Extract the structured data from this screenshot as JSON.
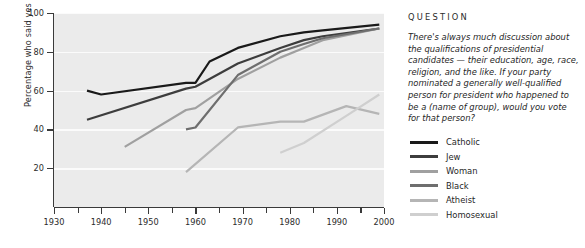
{
  "question": {
    "heading": "QUESTION",
    "body": "There's always much discussion about the qualifications of presidential candidates — their education, age, race, religion, and the like. If your party nominated a generally well-qualified person for president who happened to be a (name of group), would you vote for that person?"
  },
  "chart_data": {
    "type": "line",
    "title": "",
    "xlabel": "",
    "ylabel": "Percentage who said yes",
    "xlim": [
      1930,
      2000
    ],
    "ylim": [
      0,
      100
    ],
    "xticks": [
      1930,
      1940,
      1950,
      1960,
      1970,
      1980,
      1990,
      2000
    ],
    "xticks_minor": [
      1935,
      1945,
      1955,
      1965,
      1975,
      1985,
      1995
    ],
    "yticks": [
      20,
      40,
      60,
      80,
      100
    ],
    "grid": "horizontal",
    "legend_position": "right",
    "plot_background": "#ebebeb",
    "series": [
      {
        "name": "Catholic",
        "color": "#1a1a1a",
        "x": [
          1937,
          1940,
          1958,
          1960,
          1963,
          1969,
          1978,
          1983,
          1987,
          1999
        ],
        "values": [
          60,
          58,
          64,
          64,
          75,
          82,
          88,
          90,
          91,
          94
        ]
      },
      {
        "name": "Jew",
        "color": "#3d3d3d",
        "x": [
          1937,
          1958,
          1960,
          1969,
          1978,
          1983,
          1987,
          1999
        ],
        "values": [
          45,
          61,
          62,
          74,
          82,
          86,
          88,
          92
        ]
      },
      {
        "name": "Woman",
        "color": "#a0a0a0",
        "x": [
          1945,
          1958,
          1960,
          1969,
          1978,
          1983,
          1987,
          1999
        ],
        "values": [
          31,
          50,
          51,
          66,
          77,
          82,
          86,
          92
        ]
      },
      {
        "name": "Black",
        "color": "#6e6e6e",
        "x": [
          1958,
          1960,
          1969,
          1978,
          1983,
          1987,
          1999
        ],
        "values": [
          40,
          41,
          68,
          80,
          84,
          87,
          92
        ]
      },
      {
        "name": "Atheist",
        "color": "#b5b5b5",
        "x": [
          1958,
          1969,
          1978,
          1983,
          1992,
          1999
        ],
        "values": [
          18,
          41,
          44,
          44,
          52,
          48
        ]
      },
      {
        "name": "Homosexual",
        "color": "#cfcfcf",
        "x": [
          1978,
          1983,
          1992,
          1999
        ],
        "values": [
          28,
          33,
          47,
          58
        ]
      }
    ]
  },
  "legend": {
    "items": [
      {
        "label": "Catholic",
        "color": "#1a1a1a"
      },
      {
        "label": "Jew",
        "color": "#3d3d3d"
      },
      {
        "label": "Woman",
        "color": "#a0a0a0"
      },
      {
        "label": "Black",
        "color": "#6e6e6e"
      },
      {
        "label": "Atheist",
        "color": "#b5b5b5"
      },
      {
        "label": "Homosexual",
        "color": "#cfcfcf"
      }
    ]
  }
}
